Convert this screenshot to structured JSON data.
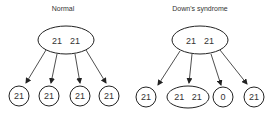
{
  "panels": [
    {
      "title": "Normal",
      "parent": {
        "label_a": "21",
        "label_b": "21"
      },
      "children": [
        {
          "label": "21"
        },
        {
          "label": "21"
        },
        {
          "label": "21"
        },
        {
          "label": "21"
        }
      ]
    },
    {
      "title": "Down's syndrome",
      "parent": {
        "label_a": "21",
        "label_b": "21"
      },
      "children": [
        {
          "label": "21"
        },
        {
          "label": "21   21"
        },
        {
          "label": "0"
        },
        {
          "label": "21"
        }
      ]
    }
  ]
}
